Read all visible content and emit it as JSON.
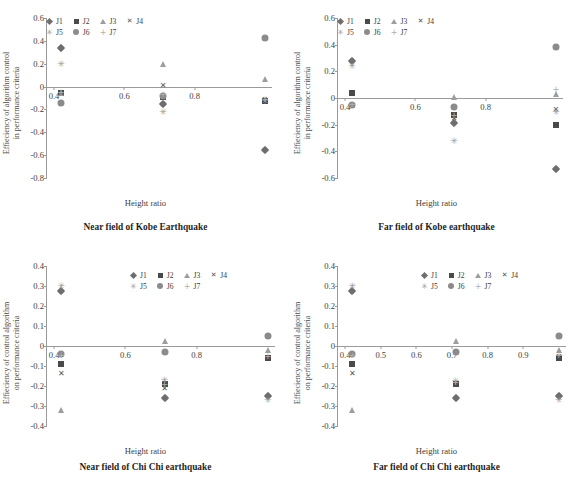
{
  "figure": {
    "series_names": [
      "J1",
      "J2",
      "J3",
      "J4",
      "J5",
      "J6",
      "J7"
    ],
    "marker_glyphs": {
      "J1": "diamond",
      "J2": "square",
      "J3": "triangle",
      "J4": "cross",
      "J5": "star",
      "J6": "circle",
      "J7": "plus"
    },
    "glyph_chars": {
      "cross": "✕",
      "star": "✳",
      "plus": "+"
    },
    "colors": {
      "J1": "#6e6e6e",
      "J2": "#4a4a4a",
      "J3": "#9d9d9d",
      "J4": "#555555",
      "J5": "#9b9b9b",
      "J6": "#8b8b8b",
      "J7": "#b0b0b0",
      "axis": "#9a9a9a",
      "text": "#3d3d3d"
    }
  },
  "chart_data": [
    {
      "id": "near-field-kobe",
      "type": "scatter",
      "title": "Near field of Kobe Earthquake",
      "xlabel": "Height ratio",
      "ylabel": "Effieciency of algorithm control in performance criteria",
      "xlim": [
        0.38,
        1.02
      ],
      "ylim": [
        -0.8,
        0.6
      ],
      "yticks": [
        0.6,
        0.4,
        0.2,
        0,
        -0.2,
        -0.4,
        -0.6,
        -0.8
      ],
      "ytick_labels": [
        "0.6",
        "0.4",
        "0.2",
        "0",
        "-0.2",
        "-0.4",
        "-0.6",
        "-0.8"
      ],
      "xticks": [
        0.4,
        0.6,
        0.8
      ],
      "xtick_labels": [
        "0.4",
        "0.6",
        "0.8"
      ],
      "grid": false,
      "legend": "top-left-inside",
      "x": [
        0.42,
        0.71,
        1.0
      ],
      "series": [
        {
          "name": "J1",
          "values": [
            0.335,
            -0.155,
            -0.555
          ]
        },
        {
          "name": "J2",
          "values": [
            -0.055,
            -0.095,
            -0.125
          ]
        },
        {
          "name": "J3",
          "values": [
            -0.06,
            0.195,
            0.065
          ]
        },
        {
          "name": "J4",
          "values": [
            -0.065,
            0.005,
            -0.115
          ]
        },
        {
          "name": "J5",
          "values": [
            0.2,
            -0.22,
            -0.125
          ]
        },
        {
          "name": "J6",
          "values": [
            -0.14,
            -0.085,
            0.425
          ]
        },
        {
          "name": "J7",
          "values": [
            -0.06,
            -0.075,
            -0.12
          ]
        }
      ]
    },
    {
      "id": "far-field-kobe",
      "type": "scatter",
      "title": "Far field of Kobe earthquake",
      "xlabel": "Height ratio",
      "ylabel": "Effieciency of algorithm control in performance criteria",
      "xlim": [
        0.38,
        1.02
      ],
      "ylim": [
        -0.6,
        0.6
      ],
      "yticks": [
        0.6,
        0.4,
        0.2,
        0,
        -0.2,
        -0.4,
        -0.6
      ],
      "ytick_labels": [
        "0.6",
        "0.4",
        "0.2",
        "0",
        "-0.2",
        "-0.4",
        "-0.6"
      ],
      "xticks": [
        0.4,
        0.6,
        0.8
      ],
      "xtick_labels": [
        "0.4",
        "0.6",
        "0.8"
      ],
      "grid": false,
      "legend": "top-left-inside",
      "x": [
        0.42,
        0.71,
        1.0
      ],
      "series": [
        {
          "name": "J1",
          "values": [
            0.28,
            -0.185,
            -0.53
          ]
        },
        {
          "name": "J2",
          "values": [
            0.035,
            -0.125,
            -0.205
          ]
        },
        {
          "name": "J3",
          "values": [
            -0.055,
            0.005,
            0.03
          ]
        },
        {
          "name": "J4",
          "values": [
            -0.06,
            -0.155,
            -0.09
          ]
        },
        {
          "name": "J5",
          "values": [
            0.24,
            -0.32,
            -0.105
          ]
        },
        {
          "name": "J6",
          "values": [
            -0.055,
            -0.065,
            0.385
          ]
        },
        {
          "name": "J7",
          "values": [
            -0.05,
            -0.135,
            0.06
          ]
        }
      ]
    },
    {
      "id": "near-field-chichi",
      "type": "scatter",
      "title": "Near field of Chi Chi earthquake",
      "xlabel": "Height ratio",
      "ylabel": "Effieciency of control algorithm on performance criteria",
      "xlim": [
        0.38,
        1.02
      ],
      "ylim": [
        -0.4,
        0.4
      ],
      "yticks": [
        0.4,
        0.3,
        0.2,
        0.1,
        0,
        -0.1,
        -0.2,
        -0.3,
        -0.4
      ],
      "ytick_labels": [
        "0.4",
        "0.3",
        "0.2",
        "0.1",
        "0",
        "-0.1",
        "-0.2",
        "-0.3",
        "-0.4"
      ],
      "xticks": [
        0.4,
        0.6,
        0.8
      ],
      "xtick_labels": [
        "0.4",
        "0.6",
        "0.8"
      ],
      "grid": false,
      "legend": "top-right-inside",
      "x": [
        0.42,
        0.71,
        1.0
      ],
      "series": [
        {
          "name": "J1",
          "values": [
            0.275,
            -0.26,
            -0.25
          ]
        },
        {
          "name": "J2",
          "values": [
            -0.09,
            -0.19,
            -0.06
          ]
        },
        {
          "name": "J3",
          "values": [
            -0.32,
            0.025,
            -0.02
          ]
        },
        {
          "name": "J4",
          "values": [
            -0.14,
            -0.215,
            -0.06
          ]
        },
        {
          "name": "J5",
          "values": [
            0.3,
            -0.17,
            -0.27
          ]
        },
        {
          "name": "J6",
          "values": [
            -0.04,
            -0.03,
            0.05
          ]
        },
        {
          "name": "J7",
          "values": [
            -0.05,
            -0.195,
            -0.055
          ]
        }
      ]
    },
    {
      "id": "far-field-chichi",
      "type": "scatter",
      "title": "Far field of Chi Chi earthquake",
      "xlabel": "Height ratio",
      "ylabel": "Effieciency of control algorithm on performance criteria",
      "xlim": [
        0.38,
        1.02
      ],
      "ylim": [
        -0.4,
        0.4
      ],
      "yticks": [
        0.4,
        0.3,
        0.2,
        0.1,
        0,
        -0.1,
        -0.2,
        -0.3,
        -0.4
      ],
      "ytick_labels": [
        "0.4",
        "0.3",
        "0.2",
        "0.1",
        "0",
        "-0.1",
        "-0.2",
        "-0.3",
        "-0.4"
      ],
      "xticks": [
        0.4,
        0.5,
        0.6,
        0.7,
        0.8,
        0.9
      ],
      "xtick_labels": [
        "0.4",
        "0.5",
        "0.6",
        "0.7",
        "0.8",
        "0.9"
      ],
      "grid": false,
      "legend": "top-right-inside",
      "x": [
        0.42,
        0.71,
        1.0
      ],
      "series": [
        {
          "name": "J1",
          "values": [
            0.275,
            -0.26,
            -0.25
          ]
        },
        {
          "name": "J2",
          "values": [
            -0.09,
            -0.19,
            -0.06
          ]
        },
        {
          "name": "J3",
          "values": [
            -0.32,
            0.025,
            -0.02
          ]
        },
        {
          "name": "J4",
          "values": [
            -0.14,
            -0.195,
            -0.055
          ]
        },
        {
          "name": "J5",
          "values": [
            0.3,
            -0.175,
            -0.27
          ]
        },
        {
          "name": "J6",
          "values": [
            -0.04,
            -0.03,
            0.05
          ]
        },
        {
          "name": "J7",
          "values": [
            -0.05,
            -0.185,
            -0.05
          ]
        }
      ]
    }
  ]
}
